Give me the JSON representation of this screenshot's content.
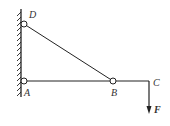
{
  "diagram": {
    "labels": {
      "D": "D",
      "A": "A",
      "B": "B",
      "C": "C",
      "F": "F"
    },
    "colors": {
      "line": "#222222",
      "label": "#333333"
    }
  }
}
